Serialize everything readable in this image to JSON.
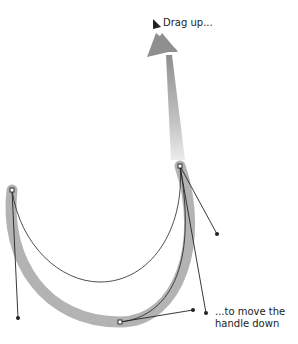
{
  "annotations": {
    "drag_up": "Drag up...",
    "move_handle": "...to move the handle down"
  },
  "icons": {
    "cursor": "arrow-cursor-icon",
    "drag_arrow": "up-arrow-icon"
  },
  "colors": {
    "background": "#ffffff",
    "path_stroke": "#222222",
    "ghost_path": "#b0b0b0",
    "arrow_top": "#8a8a8a",
    "arrow_bottom": "#e6e6e6",
    "text": "#222222"
  }
}
